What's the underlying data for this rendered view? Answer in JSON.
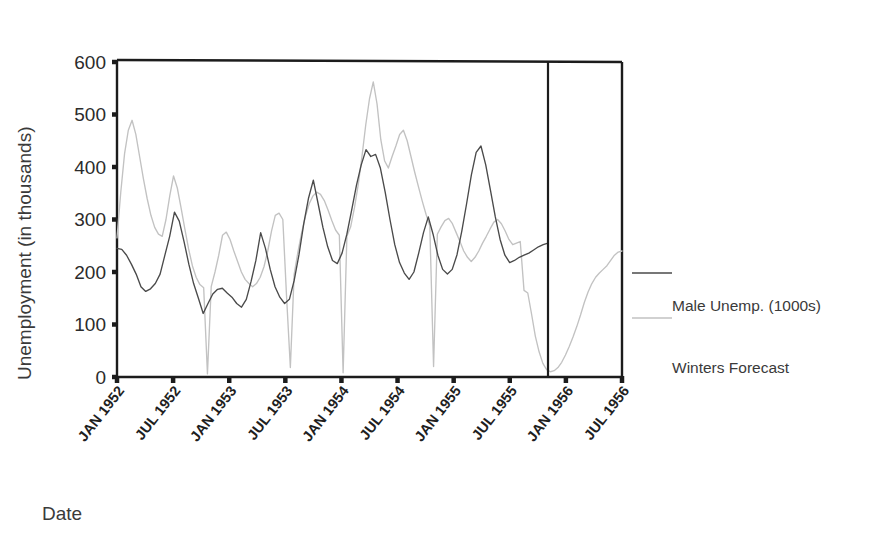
{
  "chart_data": {
    "type": "line",
    "title": "",
    "xlabel": "Date",
    "ylabel": "Unemployment (in thousands)",
    "ylim": [
      0,
      600
    ],
    "yticks": [
      0,
      100,
      200,
      300,
      400,
      500,
      600
    ],
    "ytick_labels": [
      "0",
      "100",
      "200",
      "300",
      "400",
      "500",
      "600"
    ],
    "xtick_labels": [
      "JAN 1952",
      "JUL 1952",
      "JAN 1953",
      "JUL 1953",
      "JAN 1954",
      "JUL 1954",
      "JAN 1955",
      "JUL 1955",
      "JAN 1956",
      "JUL 1956"
    ],
    "grid": false,
    "legend_position": "right",
    "forecast_divider_label": "JUL 1955",
    "forecast_divider_index": 43,
    "series": [
      {
        "name": "Male Unemp. (1000s)",
        "color": "#4a4a4a",
        "values": [
          245,
          243,
          232,
          215,
          196,
          172,
          163,
          168,
          178,
          196,
          232,
          268,
          314,
          297,
          258,
          215,
          178,
          150,
          121,
          140,
          158,
          167,
          169,
          160,
          152,
          140,
          133,
          148,
          182,
          222,
          275,
          245,
          205,
          172,
          152,
          140,
          148,
          184,
          233,
          292,
          341,
          375,
          330,
          285,
          248,
          222,
          216,
          236,
          272,
          318,
          365,
          404,
          433,
          420,
          424,
          398,
          352,
          300,
          252,
          218,
          198,
          186,
          200,
          236,
          275,
          305,
          272,
          232,
          205,
          196,
          205,
          233,
          278,
          330,
          385,
          428,
          440,
          404,
          355,
          305,
          262,
          232,
          218,
          222,
          228,
          232,
          236,
          242,
          248,
          252,
          255
        ]
      },
      {
        "name": "Winters Forecast",
        "color": "#c2c2c2",
        "values": [
          265,
          352,
          425,
          470,
          489,
          462,
          420,
          378,
          340,
          308,
          285,
          272,
          268,
          300,
          345,
          383,
          360,
          322,
          282,
          244,
          212,
          190,
          176,
          170,
          6,
          172,
          200,
          232,
          270,
          276,
          262,
          240,
          220,
          200,
          186,
          178,
          172,
          178,
          190,
          210,
          240,
          278,
          308,
          312,
          300,
          152,
          18,
          195,
          238,
          275,
          306,
          330,
          345,
          352,
          348,
          336,
          318,
          298,
          280,
          270,
          8,
          268,
          286,
          322,
          366,
          420,
          480,
          530,
          562,
          520,
          452,
          412,
          398,
          420,
          440,
          462,
          470,
          450,
          420,
          390,
          362,
          335,
          310,
          288,
          20,
          272,
          286,
          298,
          302,
          292,
          275,
          258,
          240,
          228,
          220,
          228,
          240,
          255,
          268,
          282,
          295,
          300,
          292,
          278,
          262,
          252,
          255,
          258,
          165,
          160,
          120,
          78,
          48,
          26,
          14,
          10,
          12,
          18,
          28,
          42,
          58,
          76,
          96,
          118,
          142,
          162,
          178,
          190,
          198,
          205,
          212,
          222,
          232,
          238,
          240
        ]
      }
    ],
    "legend_entries": [
      {
        "label": "Male Unemp. (1000s)",
        "color": "#4a4a4a"
      },
      {
        "label": "Winters Forecast",
        "color": "#c2c2c2"
      }
    ]
  },
  "colors": {
    "actual": "#4a4a4a",
    "forecast": "#c2c2c2",
    "frame": "#1c1c1c",
    "text": "#2b2b2b",
    "background": "#ffffff"
  }
}
